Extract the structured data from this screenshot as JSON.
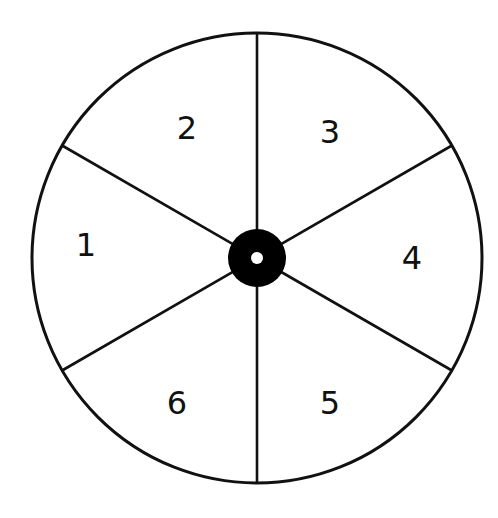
{
  "diagram": {
    "type": "spinner",
    "sector_count": 6,
    "colors": {
      "background": "#ffffff",
      "stroke": "#111111",
      "hub": "#000000",
      "hub_hole": "#ffffff"
    },
    "geometry": {
      "center": [
        257,
        258
      ],
      "radius": 225,
      "hub_radius": 29,
      "hub_hole_radius": 6,
      "divider_angles_deg": [
        90,
        30,
        -30,
        -90,
        -150,
        150
      ]
    },
    "sectors": [
      {
        "label": "1",
        "position": "left",
        "x": 86,
        "y": 245
      },
      {
        "label": "2",
        "position": "upper-left",
        "x": 187,
        "y": 128
      },
      {
        "label": "3",
        "position": "upper-right",
        "x": 330,
        "y": 132
      },
      {
        "label": "4",
        "position": "right",
        "x": 412,
        "y": 258
      },
      {
        "label": "5",
        "position": "lower-right",
        "x": 330,
        "y": 403
      },
      {
        "label": "6",
        "position": "lower-left",
        "x": 177,
        "y": 403
      }
    ]
  }
}
